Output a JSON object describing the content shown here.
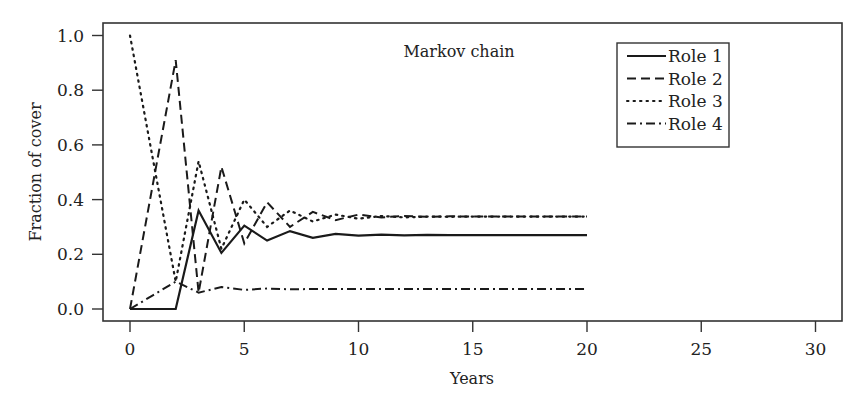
{
  "chart_data": {
    "type": "line",
    "title": "Markov chain",
    "xlabel": "Years",
    "ylabel": "Fraction of cover",
    "xlim": [
      -1.2,
      31.2
    ],
    "ylim": [
      -0.04,
      1.05
    ],
    "xticks": [
      0,
      5,
      10,
      15,
      20,
      25,
      30
    ],
    "yticks": [
      "0.0",
      "0.2",
      "0.4",
      "0.6",
      "0.8",
      "1.0"
    ],
    "grid": false,
    "legend_position": "upper right (inset)",
    "x": [
      0,
      1,
      2,
      3,
      4,
      5,
      6,
      7,
      8,
      9,
      10,
      11,
      12,
      13,
      14,
      15,
      16,
      17,
      18,
      19,
      20
    ],
    "series": [
      {
        "name": "Role 1",
        "style": "solid",
        "values": [
          0.0,
          0.0,
          0.0,
          0.36,
          0.205,
          0.305,
          0.25,
          0.285,
          0.26,
          0.275,
          0.268,
          0.272,
          0.269,
          0.271,
          0.27,
          0.27,
          0.27,
          0.27,
          0.27,
          0.27,
          0.27
        ]
      },
      {
        "name": "Role 2",
        "style": "dashed",
        "values": [
          0.0,
          0.455,
          0.91,
          0.06,
          0.52,
          0.24,
          0.39,
          0.3,
          0.355,
          0.325,
          0.345,
          0.335,
          0.34,
          0.337,
          0.339,
          0.338,
          0.338,
          0.338,
          0.338,
          0.338,
          0.338
        ]
      },
      {
        "name": "Role 3",
        "style": "dotted",
        "values": [
          1.0,
          0.55,
          0.1,
          0.54,
          0.22,
          0.4,
          0.3,
          0.36,
          0.32,
          0.345,
          0.33,
          0.34,
          0.335,
          0.338,
          0.337,
          0.338,
          0.338,
          0.338,
          0.338,
          0.338,
          0.338
        ]
      },
      {
        "name": "Role 4",
        "style": "dashdot",
        "values": [
          0.0,
          0.05,
          0.1,
          0.06,
          0.08,
          0.07,
          0.075,
          0.072,
          0.073,
          0.073,
          0.073,
          0.073,
          0.073,
          0.073,
          0.073,
          0.073,
          0.073,
          0.073,
          0.073,
          0.073,
          0.073
        ]
      }
    ]
  },
  "legend": {
    "items": [
      {
        "label": "Role 1",
        "dash": ""
      },
      {
        "label": "Role 2",
        "dash": "9,5"
      },
      {
        "label": "Role 3",
        "dash": "1.5,5"
      },
      {
        "label": "Role 4",
        "dash": "9,4,2,4"
      }
    ]
  },
  "colors": {
    "line": "#1a1a1a",
    "axis": "#333333",
    "background": "#ffffff"
  }
}
